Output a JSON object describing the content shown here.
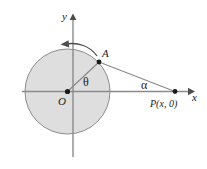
{
  "figure": {
    "labels": {
      "y_axis": "y",
      "x_axis": "x",
      "origin": "O",
      "point_a": "A",
      "theta": "θ",
      "alpha": "α",
      "point_p": "P(x, 0)"
    },
    "icons": {
      "rotation_arrow": "counterclockwise-arrow-icon",
      "x_axis_arrow": "right-arrow-icon",
      "y_axis_arrow": "up-arrow-icon"
    },
    "colors": {
      "background": "#ffffff",
      "circle_fill": "#dedede",
      "circle_stroke": "#8c8c8c",
      "axis": "#808080",
      "ray": "#8a8a8a",
      "point": "#1a1a1a",
      "text": "#1a1a1a"
    },
    "geometry": {
      "circle_center": [
        67.5,
        91.5
      ],
      "circle_radius": 42.5,
      "point_a": [
        99,
        62
      ],
      "point_p": [
        175,
        91
      ],
      "x_axis_start": [
        22,
        91
      ],
      "x_axis_end": [
        190,
        91
      ],
      "y_axis_top": [
        73,
        14
      ],
      "y_axis_bottom": [
        73,
        157
      ]
    }
  }
}
